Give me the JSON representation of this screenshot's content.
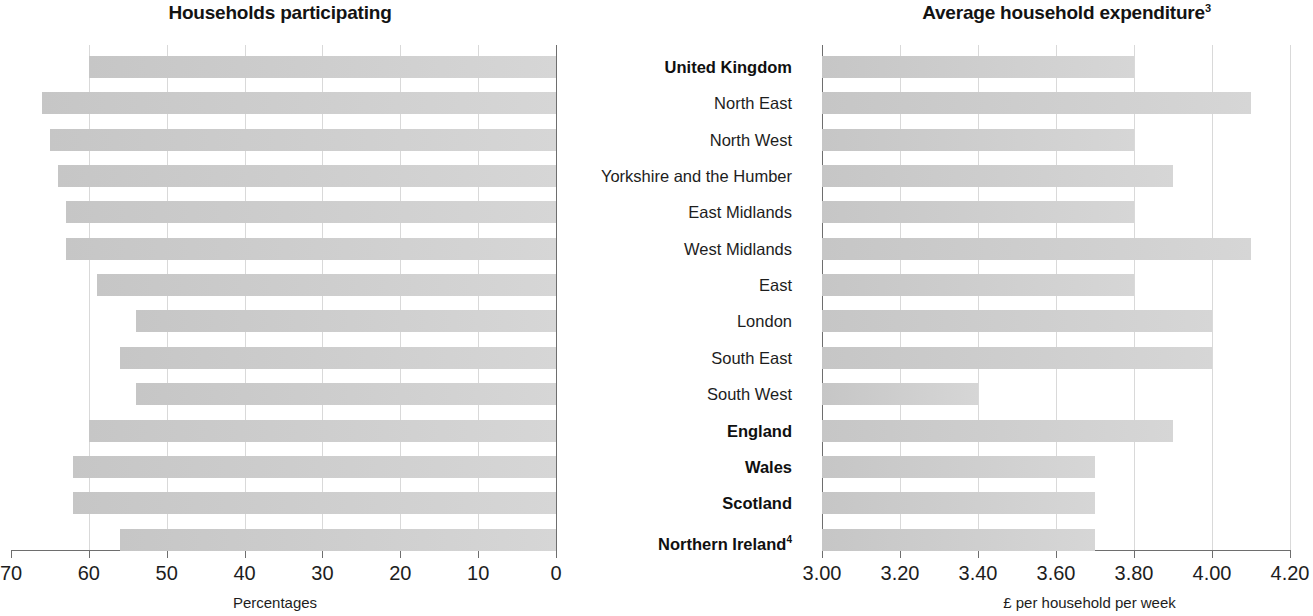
{
  "charts": {
    "left": {
      "title": "Households participating",
      "xlabel": "Percentages",
      "ticks": [
        "70",
        "60",
        "50",
        "40",
        "30",
        "20",
        "10",
        "0"
      ]
    },
    "right": {
      "title": "Average household expenditure",
      "title_superscript": "3",
      "xlabel": "£ per household per week",
      "ticks": [
        "3.00",
        "3.20",
        "3.40",
        "3.60",
        "3.80",
        "4.00",
        "4.20"
      ]
    }
  },
  "categories": [
    {
      "label": "United Kingdom",
      "bold": true,
      "superscript": ""
    },
    {
      "label": "North East",
      "bold": false,
      "superscript": ""
    },
    {
      "label": "North West",
      "bold": false,
      "superscript": ""
    },
    {
      "label": "Yorkshire and the Humber",
      "bold": false,
      "superscript": ""
    },
    {
      "label": "East Midlands",
      "bold": false,
      "superscript": ""
    },
    {
      "label": "West Midlands",
      "bold": false,
      "superscript": ""
    },
    {
      "label": "East",
      "bold": false,
      "superscript": ""
    },
    {
      "label": "London",
      "bold": false,
      "superscript": ""
    },
    {
      "label": "South East",
      "bold": false,
      "superscript": ""
    },
    {
      "label": "South West",
      "bold": false,
      "superscript": ""
    },
    {
      "label": "England",
      "bold": true,
      "superscript": ""
    },
    {
      "label": "Wales",
      "bold": true,
      "superscript": ""
    },
    {
      "label": "Scotland",
      "bold": true,
      "superscript": ""
    },
    {
      "label": "Northern Ireland",
      "bold": true,
      "superscript": "4"
    }
  ],
  "chart_data": [
    {
      "type": "bar",
      "orientation": "horizontal",
      "title": "Households participating",
      "xlabel": "Percentages",
      "ylabel": "",
      "xlim": [
        70,
        0
      ],
      "reversed_x_axis": true,
      "grid": true,
      "legend": "none",
      "bar_color": "#cbcbcb",
      "categories": [
        "United Kingdom",
        "North East",
        "North West",
        "Yorkshire and the Humber",
        "East Midlands",
        "West Midlands",
        "East",
        "London",
        "South East",
        "South West",
        "England",
        "Wales",
        "Scotland",
        "Northern Ireland"
      ],
      "values": [
        60,
        66,
        65,
        64,
        63,
        63,
        59,
        54,
        56,
        54,
        60,
        62,
        62,
        56
      ],
      "tick_labels": [
        "70",
        "60",
        "50",
        "40",
        "30",
        "20",
        "10",
        "0"
      ]
    },
    {
      "type": "bar",
      "orientation": "horizontal",
      "title": "Average household expenditure",
      "title_superscript": "3",
      "xlabel": "£ per household per week",
      "ylabel": "",
      "xlim": [
        3.0,
        4.2
      ],
      "reversed_x_axis": false,
      "grid": true,
      "legend": "none",
      "bar_color": "#d2d2d2",
      "categories": [
        "United Kingdom",
        "North East",
        "North West",
        "Yorkshire and the Humber",
        "East Midlands",
        "West Midlands",
        "East",
        "London",
        "South East",
        "South West",
        "England",
        "Wales",
        "Scotland",
        "Northern Ireland"
      ],
      "values": [
        3.8,
        4.1,
        3.8,
        3.9,
        3.8,
        4.1,
        3.8,
        4.0,
        4.0,
        3.4,
        3.9,
        3.7,
        3.7,
        3.7
      ],
      "tick_labels": [
        "3.00",
        "3.20",
        "3.40",
        "3.60",
        "3.80",
        "4.00",
        "4.20"
      ]
    }
  ]
}
